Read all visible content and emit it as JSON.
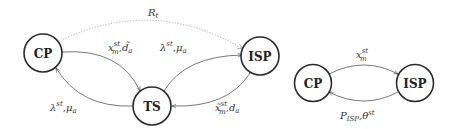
{
  "left_diagram": {
    "nodes": {
      "cp": {
        "label": "CP"
      },
      "ts": {
        "label": "TS"
      },
      "isp": {
        "label": "ISP"
      }
    },
    "edges": {
      "cp_to_isp_dotted": {
        "base": "R",
        "sub": "t"
      },
      "cp_to_ts": {
        "base": "x",
        "sup": "st",
        "sub": "m",
        "sep": ",",
        "base2": "d̃",
        "sub2": "a"
      },
      "ts_to_isp": {
        "base": "λ",
        "sup": "st",
        "sep": ",",
        "base2": "μ",
        "sub2": "a"
      },
      "ts_to_cp": {
        "base": "λ",
        "sup": "st",
        "sep": ",",
        "base2": "μ",
        "sub2": "a"
      },
      "isp_to_ts": {
        "base": "x̃",
        "sup": "st",
        "sub": "m",
        "sep": ",",
        "base2": "d",
        "sub2": "a"
      }
    }
  },
  "right_diagram": {
    "nodes": {
      "cp": {
        "label": "CP"
      },
      "isp": {
        "label": "ISP"
      }
    },
    "edges": {
      "cp_to_isp": {
        "base": "x",
        "sup": "st",
        "sub": "m"
      },
      "isp_to_cp": {
        "base": "P",
        "sub": "ISP",
        "sep": ",",
        "base2": "θ",
        "sup2": "st"
      }
    }
  },
  "colors": {
    "node_stroke": "#2a2a2a",
    "edge": "#555555",
    "dotted_edge": "#b0b0b0",
    "background": "#ffffff"
  }
}
